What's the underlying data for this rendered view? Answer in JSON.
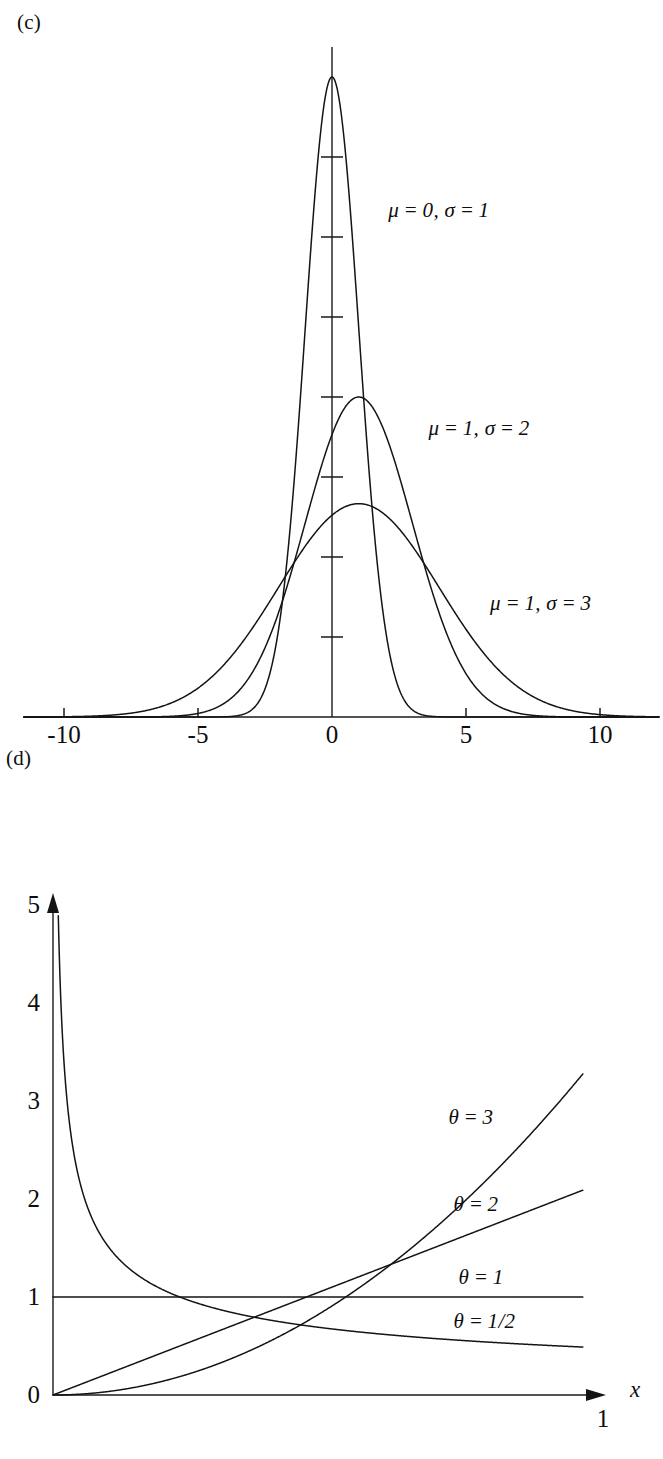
{
  "figure": {
    "background": "#ffffff",
    "ink_color": "#141414"
  },
  "panels": [
    {
      "id": "c",
      "label": "(c)",
      "chart_ref": 0
    },
    {
      "id": "d",
      "label": "(d)",
      "chart_ref": 1
    }
  ],
  "chart_data": [
    {
      "type": "line",
      "panel": "(c)",
      "title": "",
      "xlabel": "",
      "ylabel": "",
      "xlim": [
        -11.5,
        12.2
      ],
      "ylim": [
        0,
        0.455
      ],
      "grid": false,
      "legend": "inline-annotations",
      "x_ticks": [
        -10,
        -5,
        0,
        5,
        10
      ],
      "x_tick_labels": [
        "-10",
        "-5",
        "0",
        "5",
        "10"
      ],
      "y_ticks_count": 7,
      "y_tick_labels": [],
      "y_axis_at_x": 0,
      "function": "normal probability density f(x) = exp(-(x-mu)^2/(2*sigma^2)) / (sigma*sqrt(2*pi))",
      "series": [
        {
          "name": "mu = 0, sigma = 1",
          "mu": 0,
          "sigma": 1,
          "peak_value": 0.3989,
          "annotation": "μ = 0, σ = 1",
          "annotation_x": 2.1,
          "annotation_y": 0.315
        },
        {
          "name": "mu = 1, sigma = 2",
          "mu": 1,
          "sigma": 2,
          "peak_value": 0.1995,
          "annotation": "μ = 1, σ = 2",
          "annotation_x": 3.6,
          "annotation_y": 0.179
        },
        {
          "name": "mu = 1, sigma = 3",
          "mu": 1,
          "sigma": 3,
          "peak_value": 0.133,
          "annotation": "μ = 1, σ = 3",
          "annotation_x": 5.9,
          "annotation_y": 0.07
        }
      ]
    },
    {
      "type": "line",
      "panel": "(d)",
      "title": "",
      "xlabel": "x",
      "ylabel": "",
      "xlim": [
        0,
        1.0
      ],
      "ylim": [
        0,
        5
      ],
      "grid": false,
      "legend": "inline-annotations",
      "x_ticks": [
        1
      ],
      "x_tick_labels": [
        "1"
      ],
      "y_ticks": [
        0,
        1,
        2,
        3,
        4,
        5
      ],
      "y_tick_labels": [
        "0",
        "1",
        "2",
        "3",
        "4",
        "5"
      ],
      "x_axis_arrow": true,
      "y_axis_arrow": true,
      "function": "beta density f(x) = theta * x^(theta-1) on [0,1]",
      "series": [
        {
          "name": "theta = 3",
          "theta": 3,
          "value_at_1": 3.0,
          "value_at_0": 0.0,
          "annotation": "θ = 3",
          "annotation_x": 0.78,
          "annotation_y": 2.82
        },
        {
          "name": "theta = 2",
          "theta": 2,
          "value_at_1": 2.0,
          "value_at_0": 0.0,
          "annotation": "θ = 2",
          "annotation_x": 0.79,
          "annotation_y": 1.93
        },
        {
          "name": "theta = 1",
          "theta": 1,
          "value_at_1": 1.0,
          "value_at_0": 1.0,
          "annotation": "θ = 1",
          "annotation_x": 0.8,
          "annotation_y": 1.18
        },
        {
          "name": "theta = 1/2",
          "theta": 0.5,
          "value_at_1": 0.5,
          "value_at_0": 5.0,
          "annotation": "θ = 1/2",
          "annotation_x": 0.79,
          "annotation_y": 0.73
        }
      ]
    }
  ]
}
